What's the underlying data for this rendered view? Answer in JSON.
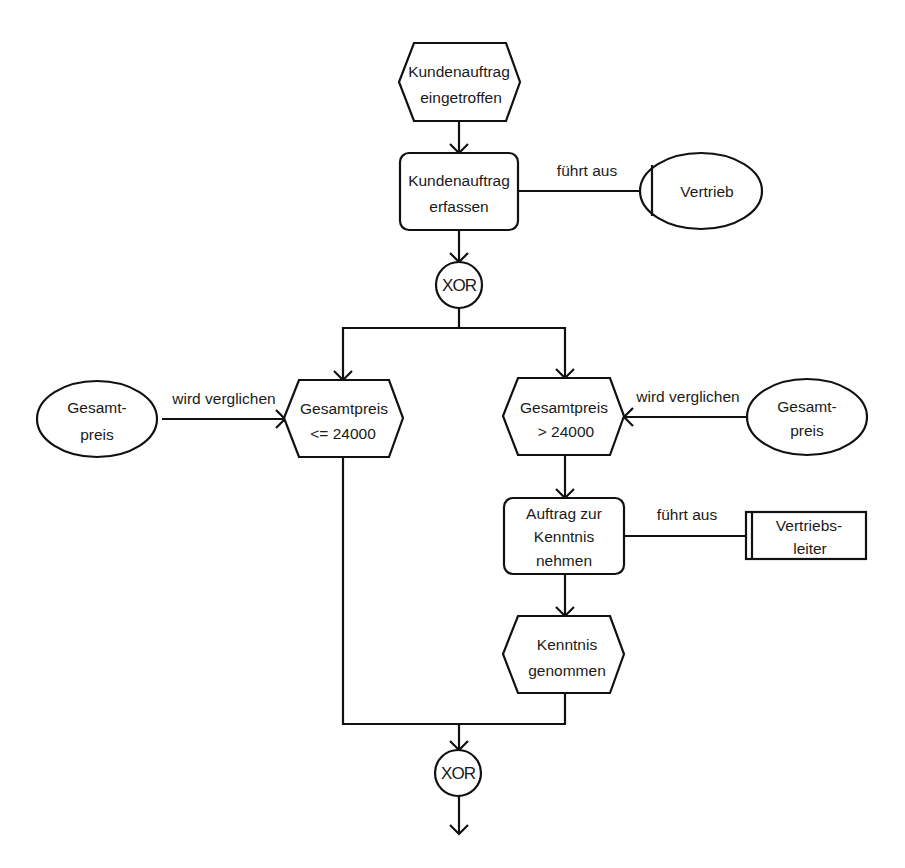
{
  "diagram": {
    "type": "EPC (Ereignisgesteuerte Prozesskette)",
    "colors": {
      "stroke": "#111111",
      "background": "#ffffff",
      "text": "#1a1a1a"
    },
    "nodes": {
      "event_start": {
        "kind": "event",
        "line1": "Kundenauftrag",
        "line2": "eingetroffen"
      },
      "function_erfassen": {
        "kind": "function",
        "line1": "Kundenauftrag",
        "line2": "erfassen"
      },
      "org_vertrieb": {
        "kind": "organizational-unit",
        "line1": "Vertrieb"
      },
      "xor_split": {
        "kind": "connector",
        "label": "XOR"
      },
      "event_le": {
        "kind": "event",
        "line1": "Gesamtpreis",
        "line2": "<= 24000"
      },
      "event_gt": {
        "kind": "event",
        "line1": "Gesamtpreis",
        "line2": "> 24000"
      },
      "info_left": {
        "kind": "information-object",
        "line1": "Gesamt-",
        "line2": "preis"
      },
      "info_right": {
        "kind": "information-object",
        "line1": "Gesamt-",
        "line2": "preis"
      },
      "function_kenntnis": {
        "kind": "function",
        "line1": "Auftrag zur",
        "line2": "Kenntnis",
        "line3": "nehmen"
      },
      "role_vertriebsleiter": {
        "kind": "position",
        "line1": "Vertriebs-",
        "line2": "leiter"
      },
      "event_kenntnis": {
        "kind": "event",
        "line1": "Kenntnis",
        "line2": "genommen"
      },
      "xor_join": {
        "kind": "connector",
        "label": "XOR"
      }
    },
    "edges": {
      "erfassen_vertrieb": "führt aus",
      "info_left_to_le": "wird verglichen",
      "info_right_to_gt": "wird verglichen",
      "kenntnis_vertriebsleiter": "führt aus"
    }
  }
}
